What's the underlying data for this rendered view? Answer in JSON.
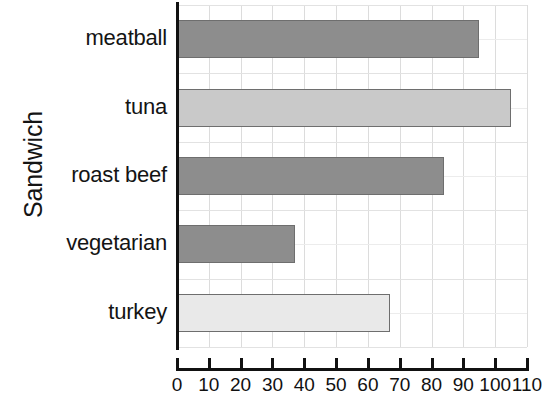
{
  "chart_data": {
    "type": "bar",
    "orientation": "horizontal",
    "title": "",
    "xlabel": "",
    "ylabel": "Sandwich",
    "categories": [
      "meatball",
      "tuna",
      "roast beef",
      "vegetarian",
      "turkey"
    ],
    "values": [
      95,
      105,
      84,
      37,
      67
    ],
    "series": [
      {
        "name": "count",
        "values": [
          95,
          105,
          84,
          37,
          67
        ]
      }
    ],
    "bar_colors": [
      "#8d8d8d",
      "#c9c9c9",
      "#8d8d8d",
      "#8d8d8d",
      "#e9e9e9"
    ],
    "bar_border_color": "#6e6e6e",
    "xlim": [
      0,
      110
    ],
    "ylim": null,
    "xticks": [
      0,
      10,
      20,
      30,
      40,
      50,
      60,
      70,
      80,
      90,
      100,
      110
    ],
    "xtick_labels": [
      "0",
      "10",
      "20",
      "30",
      "40",
      "50",
      "60",
      "70",
      "80",
      "90",
      "100",
      "110"
    ],
    "grid": true,
    "grid_axis": "both",
    "legend": false,
    "legend_position": "none",
    "annotations": []
  },
  "axis": {
    "y_title": "Sandwich"
  },
  "colors": {
    "background": "#ffffff",
    "axis_line": "#111111",
    "gridline": "#dcdcdc",
    "text": "#141414",
    "bar_dark": "#8d8d8d",
    "bar_medium": "#c9c9c9",
    "bar_light": "#e9e9e9",
    "bar_outline": "#6e6e6e"
  }
}
